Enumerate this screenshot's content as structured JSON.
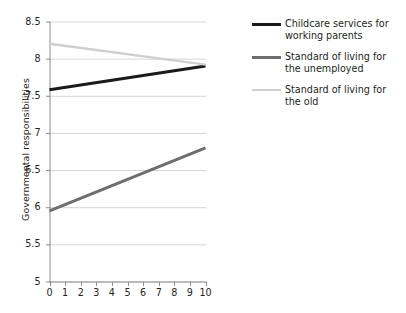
{
  "chart_data": {
    "type": "line",
    "title": "",
    "xlabel": "",
    "ylabel": "Governmental responsibilities",
    "xlim": [
      0,
      10
    ],
    "ylim": [
      5,
      8.5
    ],
    "xticks": [
      "0",
      "1",
      "2",
      "3",
      "4",
      "5",
      "6",
      "7",
      "8",
      "9",
      "10"
    ],
    "yticks": [
      "5",
      "5.5",
      "6",
      "6.5",
      "7",
      "7.5",
      "8",
      "8.5"
    ],
    "grid": "horizontal",
    "legend_position": "right",
    "x": [
      0,
      10
    ],
    "series": [
      {
        "name": "Childcare services for working parents",
        "color": "#1a1a1a",
        "width": 3.0,
        "values": [
          7.58,
          7.9
        ]
      },
      {
        "name": "Standard of living for the unemployed",
        "color": "#6e6e6e",
        "width": 3.0,
        "values": [
          5.95,
          6.8
        ]
      },
      {
        "name": "Standard of living for the old",
        "color": "#cfcfcf",
        "width": 2.4,
        "values": [
          8.2,
          7.92
        ]
      }
    ]
  },
  "axes": {
    "y_title": "Governmental responsibilities",
    "y_tick_labels": [
      "8.5",
      "8",
      "7.5",
      "7",
      "6.5",
      "6",
      "5.5",
      "5"
    ],
    "x_tick_labels": [
      "0",
      "1",
      "2",
      "3",
      "4",
      "5",
      "6",
      "7",
      "8",
      "9",
      "10"
    ]
  },
  "legend": {
    "items": [
      {
        "label_line1": "Childcare services for",
        "label_line2": "working parents",
        "color": "#1a1a1a"
      },
      {
        "label_line1": "Standard of living for",
        "label_line2": "the unemployed",
        "color": "#6e6e6e"
      },
      {
        "label_line1": "Standard of living for",
        "label_line2": "the old",
        "color": "#cfcfcf"
      }
    ]
  },
  "colors": {
    "axis": "#8c8c8c",
    "grid": "#d6d6d6",
    "text": "#231f20",
    "background": "#ffffff"
  }
}
